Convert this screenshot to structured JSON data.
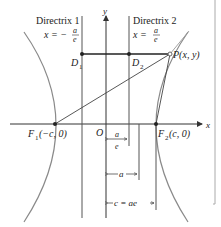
{
  "diagram": {
    "type": "hyperbola-directrix-diagram",
    "axes": {
      "x_label": "x",
      "y_label": "y",
      "origin_label": "O"
    },
    "directrix1": {
      "title": "Directrix 1",
      "equation_lhs": "x = −",
      "num": "a",
      "den": "e"
    },
    "directrix2": {
      "title": "Directrix 2",
      "equation_lhs": "x =",
      "num": "a",
      "den": "e"
    },
    "points": {
      "D1": {
        "main": "D",
        "sub": "1"
      },
      "D2": {
        "main": "D",
        "sub": "2"
      },
      "P": "P(x, y)",
      "F1": {
        "main": "F",
        "sub": "1",
        "coords": "(−c, 0)"
      },
      "F2": {
        "main": "F",
        "sub": "2",
        "coords": "(c, 0)"
      }
    },
    "dimensions": {
      "a_over_e": {
        "num": "a",
        "den": "e"
      },
      "a": "a",
      "c": "c = ae"
    },
    "colors": {
      "lines": "#555555",
      "curve": "#8a8a8a",
      "frame": "#aaaaaa"
    }
  }
}
